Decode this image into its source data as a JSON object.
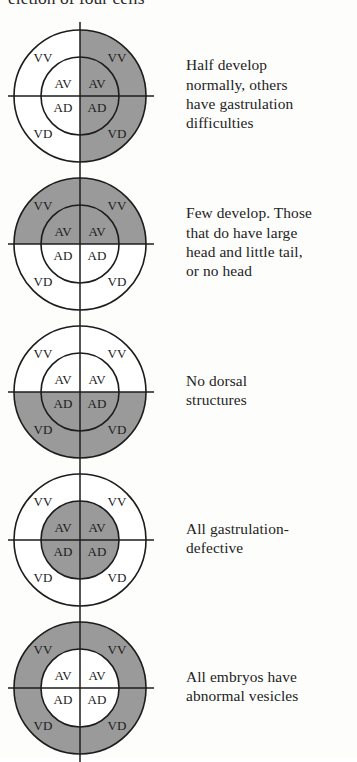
{
  "figure": {
    "heading_partial": "eletion of four cells",
    "label_ring_outer": [
      "VV",
      "VV",
      "VD",
      "VD"
    ],
    "label_ring_inner": [
      "AV",
      "AV",
      "AD",
      "AD"
    ],
    "colors": {
      "shaded": "#9a9a9a",
      "unshaded": "#ffffff",
      "stroke": "#1d1d1d",
      "text": "#232323",
      "background": "#fdfdfc"
    }
  },
  "rows": [
    {
      "id": "row-1",
      "shaded_regions": [
        "outer-top-right",
        "outer-bottom-right",
        "inner-top-right",
        "inner-bottom-right"
      ],
      "shading_description": "right half shaded",
      "labels": {
        "outer_tl": "VV",
        "outer_tr": "VV",
        "outer_bl": "VD",
        "outer_br": "VD",
        "inner_tl": "AV",
        "inner_tr": "AV",
        "inner_bl": "AD",
        "inner_br": "AD"
      },
      "caption_lines": [
        "Half develop",
        "normally, others",
        "have gastrulation",
        "difficulties"
      ]
    },
    {
      "id": "row-2",
      "shaded_regions": [
        "outer-top-left",
        "outer-top-right",
        "inner-top-left",
        "inner-top-right"
      ],
      "shading_description": "top half shaded",
      "labels": {
        "outer_tl": "VV",
        "outer_tr": "VV",
        "outer_bl": "VD",
        "outer_br": "VD",
        "inner_tl": "AV",
        "inner_tr": "AV",
        "inner_bl": "AD",
        "inner_br": "AD"
      },
      "caption_lines": [
        "Few develop. Those",
        "that do have large",
        "head and little tail,",
        "or no head"
      ]
    },
    {
      "id": "row-3",
      "shaded_regions": [
        "outer-bottom-left",
        "outer-bottom-right",
        "inner-bottom-left",
        "inner-bottom-right"
      ],
      "shading_description": "bottom half shaded",
      "labels": {
        "outer_tl": "VV",
        "outer_tr": "VV",
        "outer_bl": "VD",
        "outer_br": "VD",
        "inner_tl": "AV",
        "inner_tr": "AV",
        "inner_bl": "AD",
        "inner_br": "AD"
      },
      "caption_lines": [
        "No dorsal",
        "structures"
      ]
    },
    {
      "id": "row-4",
      "shaded_regions": [
        "inner-top-left",
        "inner-top-right",
        "inner-bottom-left",
        "inner-bottom-right"
      ],
      "shading_description": "inner circle fully shaded",
      "labels": {
        "outer_tl": "VV",
        "outer_tr": "VV",
        "outer_bl": "VD",
        "outer_br": "VD",
        "inner_tl": "AV",
        "inner_tr": "AV",
        "inner_bl": "AD",
        "inner_br": "AD"
      },
      "caption_lines": [
        "All gastrulation-",
        "defective"
      ]
    },
    {
      "id": "row-5",
      "shaded_regions": [
        "outer-top-left",
        "outer-top-right",
        "outer-bottom-left",
        "outer-bottom-right"
      ],
      "shading_description": "outer ring fully shaded, inner circle white",
      "labels": {
        "outer_tl": "VV",
        "outer_tr": "VV",
        "outer_bl": "VD",
        "outer_br": "VD",
        "inner_tl": "AV",
        "inner_tr": "AV",
        "inner_bl": "AD",
        "inner_br": "AD"
      },
      "caption_lines": [
        "All embryos have",
        "abnormal vesicles"
      ]
    }
  ]
}
